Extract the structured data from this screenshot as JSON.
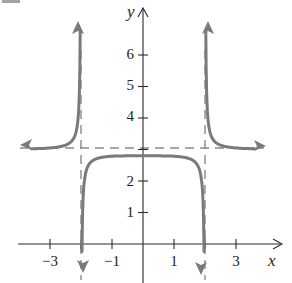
{
  "chart_data": {
    "type": "line",
    "title": "",
    "xlabel": "x",
    "ylabel": "y",
    "x_ticks": [
      -3,
      -2,
      -1,
      1,
      2,
      3
    ],
    "x_tick_labels": [
      "−3",
      "−1",
      "1",
      "3"
    ],
    "y_ticks": [
      1,
      2,
      3,
      4,
      5,
      6
    ],
    "y_tick_labels": [
      "1",
      "2",
      "4",
      "5",
      "6"
    ],
    "xlim": [
      -4,
      4.5
    ],
    "ylim": [
      -1,
      7.5
    ],
    "grid": false,
    "asymptotes": {
      "vertical": [
        -2,
        2
      ],
      "horizontal": [
        3
      ]
    },
    "series": [
      {
        "name": "left branch",
        "description": "rises from y≈3 toward +∞ as x→−2⁻",
        "points": [
          [
            -3.9,
            3.05
          ],
          [
            -3,
            3.3
          ],
          [
            -2.5,
            3.8
          ],
          [
            -2.2,
            5.0
          ],
          [
            -2.05,
            7.0
          ]
        ]
      },
      {
        "name": "middle branch",
        "description": "max ≈2.8 at x=0, falls to −∞ as x→±2",
        "points": [
          [
            -1.98,
            -0.9
          ],
          [
            -1.9,
            1.5
          ],
          [
            -1.7,
            2.4
          ],
          [
            -1,
            2.75
          ],
          [
            0,
            2.8
          ],
          [
            1,
            2.75
          ],
          [
            1.7,
            2.4
          ],
          [
            1.9,
            1.5
          ],
          [
            1.98,
            -0.9
          ]
        ]
      },
      {
        "name": "right branch",
        "description": "falls from +∞ as x→2⁺ toward y≈3",
        "points": [
          [
            2.05,
            7.0
          ],
          [
            2.2,
            5.0
          ],
          [
            2.5,
            3.8
          ],
          [
            3,
            3.3
          ],
          [
            3.9,
            3.05
          ]
        ]
      }
    ]
  },
  "labels": {
    "x_axis": "x",
    "y_axis": "y",
    "problem_fragment": "2."
  }
}
